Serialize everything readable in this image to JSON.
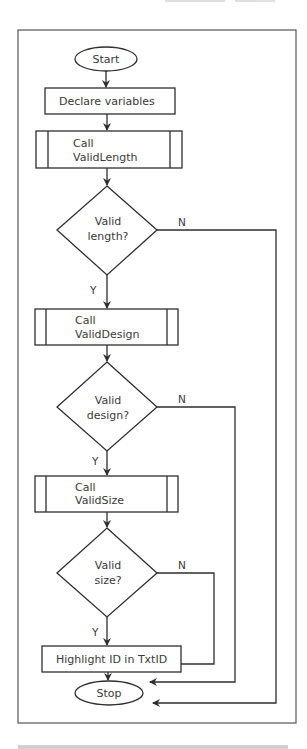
{
  "flowchart": {
    "start": "Start",
    "declare": "Declare variables",
    "call_length": {
      "line1": "Call",
      "line2": "ValidLength"
    },
    "decision_length": {
      "line1": "Valid",
      "line2": "length?"
    },
    "call_design": {
      "line1": "Call",
      "line2": "ValidDesign"
    },
    "decision_design": {
      "line1": "Valid",
      "line2": "design?"
    },
    "call_size": {
      "line1": "Call",
      "line2": "ValidSize"
    },
    "decision_size": {
      "line1": "Valid",
      "line2": "size?"
    },
    "highlight": "Highlight ID in TxtID",
    "stop": "Stop",
    "yes_label": "Y",
    "no_label": "N"
  },
  "colors": {
    "stroke": "#2e2e2e",
    "text": "#3a3a3a",
    "frame": "#555555",
    "background": "#ffffff"
  }
}
